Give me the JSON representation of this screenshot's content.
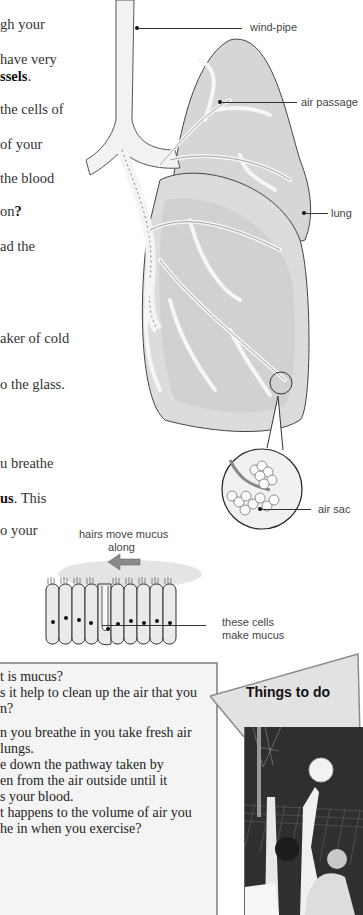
{
  "body_text": {
    "lines": [
      {
        "text": "gh your",
        "top": 16
      },
      {
        "text": "have very",
        "top": 51
      },
      {
        "text_plain": "",
        "text_bold": "ssels",
        "text_after": ".",
        "top": 68
      },
      {
        "text": "the cells of",
        "top": 101
      },
      {
        "text": "of your",
        "top": 136
      },
      {
        "text": "the blood",
        "top": 170
      },
      {
        "text_plain": "on",
        "text_bold": "?",
        "text_after": "",
        "top": 203
      },
      {
        "text": "ad the",
        "top": 238
      },
      {
        "text": "aker of cold",
        "top": 330
      },
      {
        "text": "o the glass.",
        "top": 376
      },
      {
        "text": "u breathe",
        "top": 455
      },
      {
        "text_plain": "",
        "text_bold": "us",
        "text_after": ".  This",
        "top": 490
      },
      {
        "text": "o your",
        "top": 522
      }
    ]
  },
  "diagram_lungs": {
    "labels": {
      "wind_pipe": "wind-pipe",
      "air_passage": "air passage",
      "lung": "lung",
      "air_sac": "air sac"
    }
  },
  "diagram_cells": {
    "labels": {
      "hairs": "hairs move mucus",
      "hairs_line2": "along",
      "cells": "these cells",
      "cells_line2": "make mucus"
    }
  },
  "questions_panel": {
    "lines": [
      "t is mucus?",
      "s it help to clean up the air that you",
      "n?",
      "",
      "n you breathe in you take fresh air",
      " lungs.",
      "e down the pathway taken by",
      "en from the air outside until it",
      "s your blood.",
      "t happens to the volume of air you",
      "he in when you exercise?"
    ]
  },
  "things_to_do": {
    "label": "Things to do",
    "photo_icon": "netball-photo"
  },
  "colors": {
    "panel_bg": "#f4f4f4",
    "panel_border": "#999999",
    "tab_bg": "#e2e2e2",
    "lung_fill": "#d4d4d4",
    "passage_fill": "#f4f4f4",
    "arrow": "#8a8a8a"
  }
}
